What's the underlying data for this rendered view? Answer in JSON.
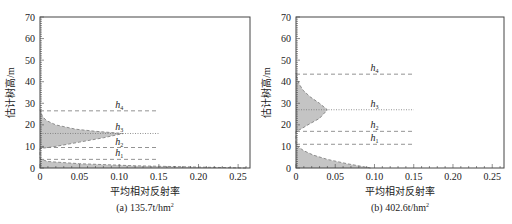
{
  "colors": {
    "frame": "#444444",
    "fill": "#c4c4c4",
    "dash": "#777777",
    "text": "#222222"
  },
  "chart_data": [
    {
      "type": "area",
      "caption": "(a)  135.7t/hm",
      "caption_sup": "2",
      "xlabel": "平均相对反射率",
      "ylabel": "估计树高/m",
      "xlim": [
        0,
        0.265
      ],
      "ylim": [
        0,
        70
      ],
      "xticks": [
        0,
        0.05,
        0.1,
        0.15,
        0.2,
        0.25
      ],
      "xtick_labels": [
        "0",
        "0.05",
        "0.10",
        "0.15",
        "0.20",
        "0.25"
      ],
      "yticks": [
        0,
        10,
        20,
        30,
        40,
        50,
        60,
        70
      ],
      "ytick_labels": [
        "0",
        "10",
        "20",
        "30",
        "40",
        "50",
        "60",
        "70"
      ],
      "grid": false,
      "profile_height": [
        0,
        1,
        2,
        3,
        4,
        4.5,
        9,
        10,
        12,
        14,
        16,
        17,
        18,
        20,
        22,
        24,
        26,
        27
      ],
      "profile_reflectance": [
        0.26,
        0.12,
        0.05,
        0.01,
        0.002,
        0,
        0,
        0.02,
        0.05,
        0.08,
        0.105,
        0.07,
        0.045,
        0.02,
        0.008,
        0.003,
        0.001,
        0
      ],
      "markers": [
        {
          "name": "h1",
          "label": "h",
          "sub": "1",
          "height": 4,
          "style": "dashed"
        },
        {
          "name": "h2",
          "label": "h",
          "sub": "2",
          "height": 9.5,
          "style": "dashed"
        },
        {
          "name": "h3",
          "label": "h",
          "sub": "3",
          "height": 16,
          "style": "dotted"
        },
        {
          "name": "h4",
          "label": "h",
          "sub": "4",
          "height": 26.5,
          "style": "dashed"
        }
      ],
      "marker_line_xmax": 0.15
    },
    {
      "type": "area",
      "caption": "(b)  402.6t/hm",
      "caption_sup": "2",
      "xlabel": "平均相对反射率",
      "ylabel": "估计树高/m",
      "xlim": [
        0,
        0.265
      ],
      "ylim": [
        0,
        70
      ],
      "xticks": [
        0,
        0.05,
        0.1,
        0.15,
        0.2,
        0.25
      ],
      "xtick_labels": [
        "0",
        "0.05",
        "0.10",
        "0.15",
        "0.20",
        "0.25"
      ],
      "yticks": [
        0,
        10,
        20,
        30,
        40,
        50,
        60,
        70
      ],
      "ytick_labels": [
        "0",
        "10",
        "20",
        "30",
        "40",
        "50",
        "60",
        "70"
      ],
      "grid": false,
      "profile_height": [
        0,
        2,
        4,
        6,
        8,
        10,
        11,
        17,
        18,
        20,
        23,
        27,
        30,
        33,
        36,
        39,
        42,
        44
      ],
      "profile_reflectance": [
        0.095,
        0.065,
        0.04,
        0.022,
        0.01,
        0.002,
        0,
        0,
        0.006,
        0.015,
        0.03,
        0.04,
        0.03,
        0.018,
        0.009,
        0.004,
        0.001,
        0
      ],
      "markers": [
        {
          "name": "h1",
          "label": "h",
          "sub": "1",
          "height": 11,
          "style": "dashed"
        },
        {
          "name": "h2",
          "label": "h",
          "sub": "2",
          "height": 17,
          "style": "dashed"
        },
        {
          "name": "h3",
          "label": "h",
          "sub": "3",
          "height": 27,
          "style": "dotted"
        },
        {
          "name": "h4",
          "label": "h",
          "sub": "4",
          "height": 43.5,
          "style": "dashed"
        }
      ],
      "marker_line_xmax": 0.15
    }
  ]
}
